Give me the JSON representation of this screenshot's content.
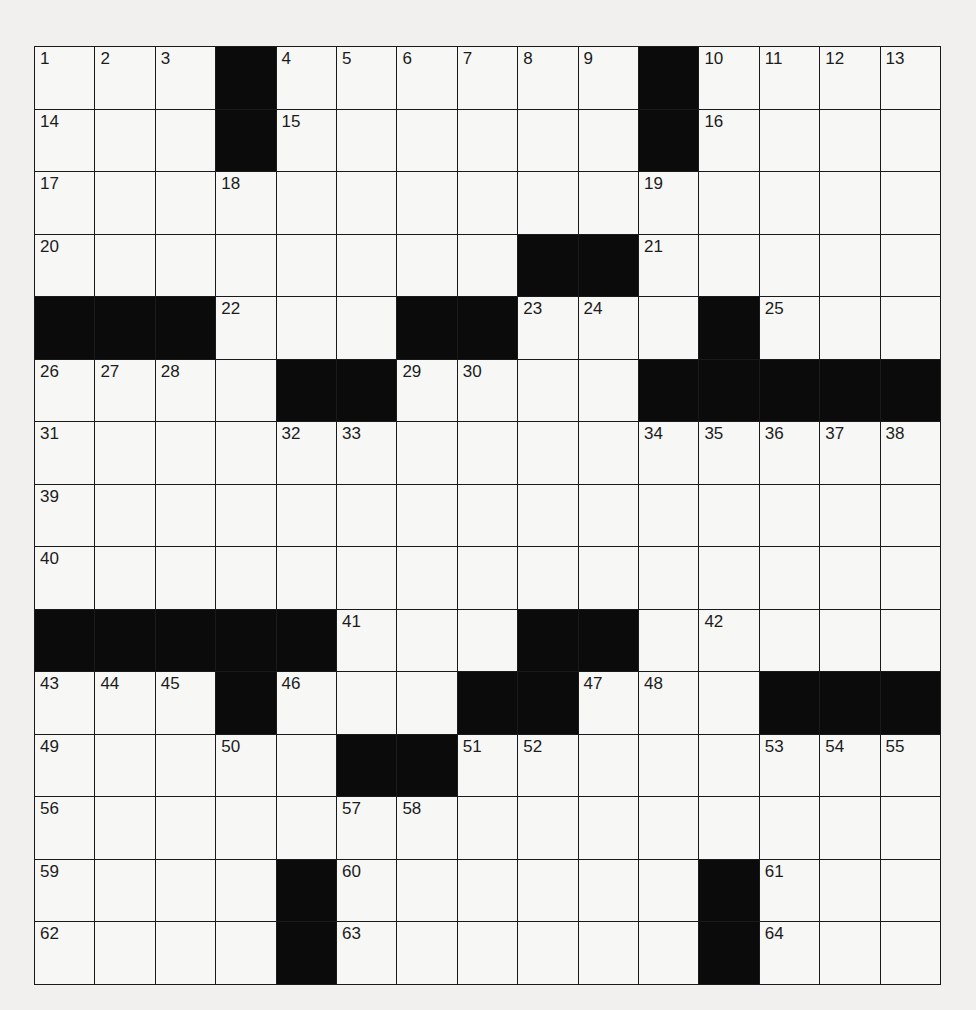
{
  "puzzle": {
    "rows": 15,
    "cols": 15,
    "colors": {
      "black": "#0b0b0b",
      "white": "#f7f7f5",
      "line": "#1a1a1a",
      "paper": "#f1f0ee"
    },
    "layout": [
      "...#......#....",
      "...#......#....",
      "...............",
      "........##.....",
      "###...##...#...",
      "....##....#####",
      "...............",
      "...............",
      "...............",
      "#####...##.....",
      "...#...##...###",
      ".....##........",
      "...............",
      "....#......#...",
      "....#......#..."
    ],
    "numbers": [
      [
        1,
        2,
        3,
        0,
        4,
        5,
        6,
        7,
        8,
        9,
        0,
        10,
        11,
        12,
        13
      ],
      [
        14,
        0,
        0,
        0,
        15,
        0,
        0,
        0,
        0,
        0,
        0,
        16,
        0,
        0,
        0
      ],
      [
        17,
        0,
        0,
        18,
        0,
        0,
        0,
        0,
        0,
        0,
        19,
        0,
        0,
        0,
        0
      ],
      [
        20,
        0,
        0,
        0,
        0,
        0,
        0,
        0,
        0,
        0,
        21,
        0,
        0,
        0,
        0
      ],
      [
        0,
        0,
        0,
        22,
        0,
        0,
        0,
        0,
        23,
        24,
        0,
        0,
        25,
        0,
        0
      ],
      [
        26,
        27,
        28,
        0,
        0,
        0,
        29,
        30,
        0,
        0,
        0,
        0,
        0,
        0,
        0
      ],
      [
        31,
        0,
        0,
        0,
        32,
        33,
        0,
        0,
        0,
        0,
        34,
        35,
        36,
        37,
        38
      ],
      [
        39,
        0,
        0,
        0,
        0,
        0,
        0,
        0,
        0,
        0,
        0,
        0,
        0,
        0,
        0
      ],
      [
        40,
        0,
        0,
        0,
        0,
        0,
        0,
        0,
        0,
        0,
        0,
        0,
        0,
        0,
        0
      ],
      [
        0,
        0,
        0,
        0,
        0,
        41,
        0,
        0,
        0,
        0,
        0,
        42,
        0,
        0,
        0
      ],
      [
        43,
        44,
        45,
        0,
        46,
        0,
        0,
        0,
        0,
        47,
        48,
        0,
        0,
        0,
        0
      ],
      [
        49,
        0,
        0,
        50,
        0,
        0,
        0,
        51,
        52,
        0,
        0,
        0,
        53,
        54,
        55
      ],
      [
        56,
        0,
        0,
        0,
        0,
        57,
        58,
        0,
        0,
        0,
        0,
        0,
        0,
        0,
        0
      ],
      [
        59,
        0,
        0,
        0,
        0,
        60,
        0,
        0,
        0,
        0,
        0,
        0,
        61,
        0,
        0
      ],
      [
        62,
        0,
        0,
        0,
        0,
        63,
        0,
        0,
        0,
        0,
        0,
        0,
        64,
        0,
        0
      ]
    ],
    "entries": []
  }
}
